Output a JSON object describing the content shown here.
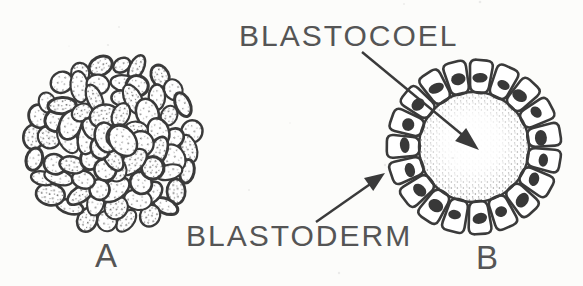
{
  "diagram": {
    "labels": {
      "blastocoel": "BLASTOCOEL",
      "blastoderm": "BLASTODERM",
      "panel_a": "A",
      "panel_b": "B"
    },
    "colors": {
      "background": "#fcfcfa",
      "ink": "#3a3a3a",
      "nucleus": "#383838",
      "label_text": "#555555"
    }
  }
}
